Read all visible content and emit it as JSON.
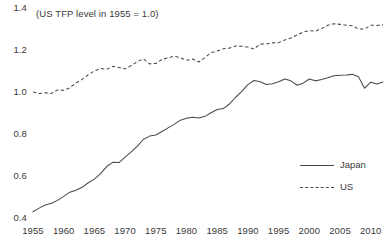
{
  "chart_data": {
    "type": "line",
    "title": "(US TFP level in 1955 = 1.0)",
    "xlabel": "",
    "ylabel": "",
    "xlim": [
      1955,
      2012
    ],
    "ylim": [
      0.4,
      1.4
    ],
    "grid": false,
    "legend_position": "bottom-right",
    "xticks": [
      "1955",
      "1960",
      "1965",
      "1970",
      "1975",
      "1980",
      "1985",
      "1990",
      "1995",
      "2000",
      "2005",
      "2010"
    ],
    "xtick_values": [
      1955,
      1960,
      1965,
      1970,
      1975,
      1980,
      1985,
      1990,
      1995,
      2000,
      2005,
      2010
    ],
    "yticks": [
      "1.4",
      "1.2",
      "1.0",
      "0.8",
      "0.6",
      "0.4"
    ],
    "ytick_values": [
      1.4,
      1.2,
      1.0,
      0.8,
      0.6,
      0.4
    ],
    "x": [
      1955,
      1956,
      1957,
      1958,
      1959,
      1960,
      1961,
      1962,
      1963,
      1964,
      1965,
      1966,
      1967,
      1968,
      1969,
      1970,
      1971,
      1972,
      1973,
      1974,
      1975,
      1976,
      1977,
      1978,
      1979,
      1980,
      1981,
      1982,
      1983,
      1984,
      1985,
      1986,
      1987,
      1988,
      1989,
      1990,
      1991,
      1992,
      1993,
      1994,
      1995,
      1996,
      1997,
      1998,
      1999,
      2000,
      2001,
      2002,
      2003,
      2004,
      2005,
      2006,
      2007,
      2008,
      2009,
      2010,
      2011,
      2012
    ],
    "series": [
      {
        "name": "Japan",
        "style": "solid",
        "color": "#4a4a4a",
        "values": [
          0.43,
          0.447,
          0.462,
          0.47,
          0.484,
          0.503,
          0.523,
          0.532,
          0.546,
          0.568,
          0.585,
          0.611,
          0.645,
          0.665,
          0.664,
          0.69,
          0.715,
          0.742,
          0.775,
          0.79,
          0.795,
          0.812,
          0.829,
          0.846,
          0.866,
          0.875,
          0.88,
          0.876,
          0.884,
          0.901,
          0.917,
          0.921,
          0.943,
          0.975,
          1.003,
          1.035,
          1.055,
          1.049,
          1.036,
          1.039,
          1.049,
          1.062,
          1.053,
          1.032,
          1.042,
          1.062,
          1.053,
          1.06,
          1.068,
          1.077,
          1.08,
          1.081,
          1.084,
          1.073,
          1.018,
          1.047,
          1.038,
          1.048
        ]
      },
      {
        "name": "US",
        "style": "dashed",
        "color": "#4a4a4a",
        "values": [
          1.0,
          0.993,
          0.996,
          0.993,
          1.01,
          1.008,
          1.02,
          1.043,
          1.06,
          1.082,
          1.1,
          1.112,
          1.108,
          1.122,
          1.117,
          1.11,
          1.126,
          1.145,
          1.157,
          1.134,
          1.136,
          1.155,
          1.163,
          1.17,
          1.163,
          1.151,
          1.157,
          1.143,
          1.164,
          1.188,
          1.195,
          1.206,
          1.209,
          1.219,
          1.218,
          1.214,
          1.205,
          1.228,
          1.229,
          1.234,
          1.235,
          1.248,
          1.257,
          1.271,
          1.285,
          1.292,
          1.29,
          1.302,
          1.318,
          1.325,
          1.322,
          1.318,
          1.315,
          1.3,
          1.3,
          1.318,
          1.317,
          1.32
        ]
      }
    ]
  },
  "legend": {
    "items": [
      {
        "label": "Japan",
        "style": "solid"
      },
      {
        "label": "US",
        "style": "dashed"
      }
    ]
  }
}
